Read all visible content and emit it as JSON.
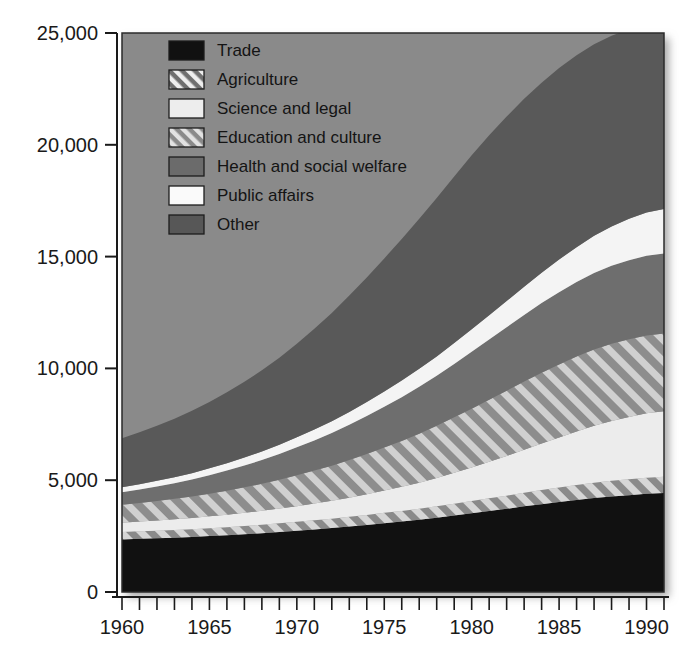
{
  "chart_data": {
    "type": "area",
    "stacked": true,
    "title": "",
    "subtitle": "",
    "xlabel": "",
    "ylabel": "",
    "xlim": [
      1960,
      1991
    ],
    "ylim": [
      0,
      25000
    ],
    "grid": false,
    "legend_position": "top-left inside plot",
    "x": [
      1960,
      1961,
      1962,
      1963,
      1964,
      1965,
      1966,
      1967,
      1968,
      1969,
      1970,
      1971,
      1972,
      1973,
      1974,
      1975,
      1976,
      1977,
      1978,
      1979,
      1980,
      1981,
      1982,
      1983,
      1984,
      1985,
      1986,
      1987,
      1988,
      1989,
      1990,
      1991
    ],
    "x_tick_labels": [
      "1960",
      "1965",
      "1970",
      "1975",
      "1980",
      "1985",
      "1990"
    ],
    "x_tick_values": [
      1960,
      1965,
      1970,
      1975,
      1980,
      1985,
      1990
    ],
    "x_minor_tick_interval": 1,
    "y_tick_labels": [
      "0",
      "5,000",
      "10,000",
      "15,000",
      "20,000",
      "25,000"
    ],
    "y_tick_values": [
      0,
      5000,
      10000,
      15000,
      20000,
      25000
    ],
    "series": [
      {
        "name": "Trade",
        "pattern": "solid",
        "color": "#111111",
        "values": [
          2350,
          2380,
          2400,
          2430,
          2460,
          2500,
          2540,
          2580,
          2630,
          2680,
          2740,
          2800,
          2860,
          2930,
          3000,
          3080,
          3150,
          3230,
          3320,
          3420,
          3520,
          3620,
          3720,
          3830,
          3930,
          4020,
          4110,
          4200,
          4270,
          4330,
          4390,
          4430
        ]
      },
      {
        "name": "Agriculture",
        "pattern": "diagonal-hatch-light",
        "color": "#c9c9c9",
        "values": [
          330,
          335,
          340,
          345,
          350,
          355,
          360,
          370,
          380,
          390,
          400,
          410,
          420,
          430,
          445,
          460,
          475,
          490,
          510,
          530,
          550,
          570,
          590,
          610,
          630,
          650,
          670,
          690,
          700,
          710,
          720,
          720
        ]
      },
      {
        "name": "Science and legal",
        "pattern": "solid",
        "color": "#ececec",
        "values": [
          420,
          440,
          460,
          480,
          500,
          530,
          560,
          590,
          620,
          660,
          700,
          750,
          800,
          860,
          930,
          1000,
          1080,
          1170,
          1270,
          1380,
          1500,
          1630,
          1770,
          1920,
          2080,
          2240,
          2400,
          2550,
          2680,
          2790,
          2880,
          2930
        ]
      },
      {
        "name": "Education and culture",
        "pattern": "diagonal-hatch-heavy",
        "color": "#bdbdbd",
        "values": [
          800,
          830,
          870,
          910,
          960,
          1010,
          1070,
          1140,
          1210,
          1290,
          1380,
          1470,
          1570,
          1680,
          1800,
          1920,
          2050,
          2190,
          2330,
          2480,
          2630,
          2780,
          2920,
          3050,
          3170,
          3270,
          3350,
          3410,
          3450,
          3470,
          3480,
          3480
        ]
      },
      {
        "name": "Health and social welfare",
        "pattern": "solid",
        "color": "#6e6e6e",
        "values": [
          560,
          600,
          650,
          700,
          760,
          830,
          900,
          980,
          1060,
          1150,
          1250,
          1350,
          1460,
          1580,
          1700,
          1830,
          1960,
          2100,
          2240,
          2390,
          2540,
          2690,
          2840,
          2980,
          3110,
          3230,
          3330,
          3420,
          3490,
          3540,
          3570,
          3580
        ]
      },
      {
        "name": "Public affairs",
        "pattern": "solid",
        "color": "#f4f4f4",
        "values": [
          220,
          235,
          250,
          265,
          285,
          305,
          330,
          355,
          385,
          415,
          450,
          490,
          530,
          575,
          625,
          680,
          740,
          800,
          865,
          935,
          1010,
          1090,
          1175,
          1265,
          1360,
          1460,
          1560,
          1660,
          1760,
          1850,
          1930,
          1990
        ]
      },
      {
        "name": "Other",
        "pattern": "solid",
        "color": "#595959",
        "values": [
          2200,
          2330,
          2470,
          2620,
          2790,
          2970,
          3170,
          3390,
          3630,
          3890,
          4180,
          4500,
          4840,
          5200,
          5570,
          5950,
          6330,
          6710,
          7090,
          7450,
          7780,
          8050,
          8250,
          8400,
          8500,
          8560,
          8580,
          8570,
          8530,
          8470,
          8400,
          8340
        ]
      }
    ],
    "totals": [
      6880,
      7150,
      7440,
      7750,
      8105,
      8500,
      8930,
      9405,
      9915,
      10475,
      11100,
      11770,
      12480,
      13255,
      14070,
      14920,
      15785,
      16690,
      17625,
      18585,
      19530,
      20430,
      21265,
      22055,
      22780,
      23430,
      24000,
      24500,
      24880,
      25160,
      25370,
      25470
    ]
  },
  "legend": {
    "items": [
      {
        "label": "Trade",
        "swatch": "solid-black"
      },
      {
        "label": "Agriculture",
        "swatch": "hatch-light"
      },
      {
        "label": "Science and legal",
        "swatch": "solid-light"
      },
      {
        "label": "Education and culture",
        "swatch": "hatch-heavy"
      },
      {
        "label": "Health and social welfare",
        "swatch": "solid-darkgray"
      },
      {
        "label": "Public affairs",
        "swatch": "solid-white"
      },
      {
        "label": "Other",
        "swatch": "solid-gray"
      }
    ]
  },
  "axes": {
    "y_labels": [
      "25,000",
      "20,000",
      "15,000",
      "10,000",
      "5,000",
      "0"
    ],
    "x_labels": [
      "1960",
      "1965",
      "1970",
      "1975",
      "1980",
      "1985",
      "1990"
    ]
  },
  "colors": {
    "plot_background": "#8a8a8a",
    "trade": "#111111",
    "agriculture_bg": "#8a8a8a",
    "agriculture_stripe": "#d2d2d2",
    "science": "#ececec",
    "education_bg": "#8f8f8f",
    "education_stripe": "#cfcfcf",
    "health": "#6e6e6e",
    "public_affairs": "#f4f4f4",
    "other": "#595959",
    "axis": "#1a1a1a",
    "text": "#1a1a1a"
  }
}
